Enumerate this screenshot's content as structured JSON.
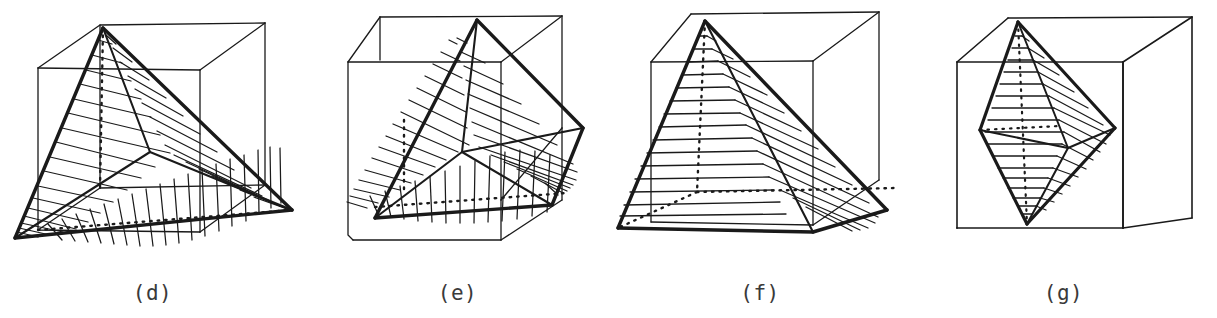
{
  "sheet": {
    "title": "Polyhedra inscribed in cubes",
    "background_color": "#ffffff",
    "ink_color": "#1a1a1a",
    "caption_color": "#3a3a3a",
    "width": 1217,
    "height": 318
  },
  "figures": [
    {
      "id": "d",
      "caption": "(d)",
      "name": "tetrahedron-in-cube",
      "description": "Hand-drawn tetrahedron inscribed in a wireframe cube, faces filled with hatching lines",
      "hatch_count_left": 17,
      "hatch_count_right": 16,
      "hatch_count_bottom": 18,
      "hidden_edges": "dotted",
      "panel_x": 0,
      "panel_width": 305
    },
    {
      "id": "e",
      "caption": "(e)",
      "name": "oblique-pyramid-in-cube",
      "description": "Hand-drawn oblique pyramid inscribed in a wireframe cube, faces filled with hatching lines",
      "hatch_count_left": 16,
      "hatch_count_right": 14,
      "hatch_count_bottom": 13,
      "hidden_edges": "dotted",
      "panel_x": 305,
      "panel_width": 305
    },
    {
      "id": "f",
      "caption": "(f)",
      "name": "square-pyramid-in-cube",
      "description": "Hand-drawn right square pyramid inscribed in a wireframe cube, faces filled with hatching lines",
      "hatch_count_left": 13,
      "hatch_count_right": 12,
      "hidden_edges": "dotted",
      "panel_x": 610,
      "panel_width": 300
    },
    {
      "id": "g",
      "caption": "(g)",
      "name": "bipyramid-in-cube",
      "description": "Hand-drawn bipyramid (octahedron-like) inscribed in a wireframe cube, faces filled with hatching lines",
      "hatch_count_left": 20,
      "hatch_count_right": 16,
      "hidden_edges": "dotted",
      "panel_x": 910,
      "panel_width": 307
    }
  ]
}
